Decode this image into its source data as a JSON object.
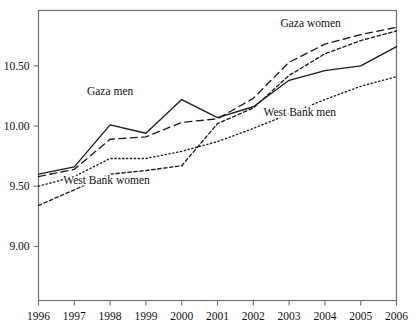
{
  "chart_data": {
    "type": "line",
    "title": "",
    "xlabel": "",
    "ylabel": "",
    "x": [
      1996,
      1997,
      1998,
      1999,
      2000,
      2001,
      2002,
      2003,
      2004,
      2005,
      2006
    ],
    "xtick_labels": [
      "1996",
      "1997",
      "1998",
      "1999",
      "2000",
      "2001",
      "2002",
      "2003",
      "2004",
      "2005",
      "2006"
    ],
    "ytick_labels": [
      "10.50",
      "10.00",
      "9.50",
      "9.00"
    ],
    "ytick_values": [
      10.5,
      10.0,
      9.5,
      9.0
    ],
    "ylim": [
      8.55,
      10.96
    ],
    "xlim": [
      1996,
      2006
    ],
    "grid": false,
    "legend": "inline-annotations",
    "series": [
      {
        "name": "Gaza men",
        "line_style": "solid",
        "label": "Gaza men",
        "label_x": 1998.0,
        "label_y": 10.26,
        "values": [
          9.6,
          9.66,
          10.01,
          9.94,
          10.22,
          10.07,
          10.16,
          10.38,
          10.46,
          10.5,
          10.66
        ]
      },
      {
        "name": "Gaza women",
        "line_style": "dashed",
        "label": "Gaza women",
        "label_x": 2003.6,
        "label_y": 10.82,
        "values": [
          9.58,
          9.64,
          9.89,
          9.91,
          10.03,
          10.06,
          10.23,
          10.53,
          10.68,
          10.76,
          10.82
        ]
      },
      {
        "name": "West Bank men",
        "line_style": "dotted",
        "label": "West Bank men",
        "label_x": 2003.3,
        "label_y": 10.08,
        "values": [
          9.5,
          9.58,
          9.73,
          9.73,
          9.79,
          9.87,
          9.98,
          10.1,
          10.22,
          10.33,
          10.41
        ]
      },
      {
        "name": "West Bank women",
        "line_style": "shortdash",
        "label": "West Bank women",
        "label_x": 1997.9,
        "label_y": 9.52,
        "values": [
          9.34,
          9.47,
          9.6,
          9.63,
          9.67,
          10.02,
          10.15,
          10.42,
          10.6,
          10.71,
          10.79
        ]
      }
    ]
  }
}
